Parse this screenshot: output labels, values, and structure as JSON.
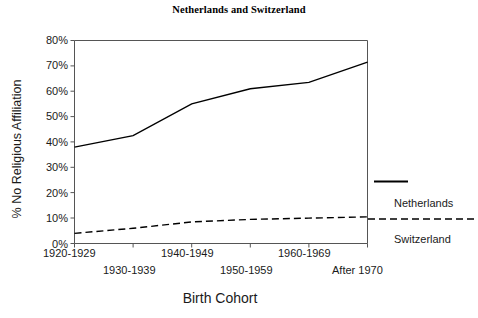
{
  "chart_data": {
    "type": "line",
    "title": "Netherlands and Switzerland",
    "xlabel": "Birth Cohort",
    "ylabel": "% No Religious Affiliation",
    "categories": [
      "1920-1929",
      "1930-1939",
      "1940-1949",
      "1950-1959",
      "1960-1969",
      "After 1970"
    ],
    "ylim": [
      0,
      80
    ],
    "yticks": [
      0,
      10,
      20,
      30,
      40,
      50,
      60,
      70,
      80
    ],
    "ytick_labels": [
      "0%",
      "10%",
      "20%",
      "30%",
      "40%",
      "50%",
      "60%",
      "70%",
      "80%"
    ],
    "grid": false,
    "legend_position": "right-outside",
    "series": [
      {
        "name": "Netherlands",
        "style": "solid",
        "color": "#000000",
        "values": [
          38,
          42.5,
          55,
          61,
          63.5,
          71.5
        ]
      },
      {
        "name": "Switzerland",
        "style": "dashed",
        "color": "#000000",
        "values": [
          4,
          6,
          8.5,
          9.5,
          10,
          10.5
        ]
      }
    ]
  },
  "legend": {
    "entries": [
      {
        "label": "Netherlands",
        "style": "solid"
      },
      {
        "label": "Switzerland",
        "style": "dashed"
      }
    ]
  }
}
